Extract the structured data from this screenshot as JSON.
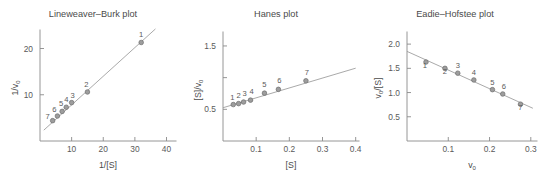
{
  "figure": {
    "background": "#ffffff",
    "ink_color": "#5a5a5a",
    "marker_fill": "#9d9d9d",
    "marker_stroke": "#6d6d6d",
    "line_color": "#9a9a9a"
  },
  "chart_data": [
    {
      "type": "scatter",
      "title": "Lineweaver–Burk plot",
      "xlabel": "1/[S]",
      "ylabel": "1/v₀",
      "ylabel_parts": {
        "main": "1/v",
        "sub": "0"
      },
      "xlim": [
        0,
        43
      ],
      "ylim": [
        0,
        24
      ],
      "xticks": [
        10,
        20,
        30,
        40
      ],
      "xtick_labels": [
        "10",
        "20",
        "30",
        "40"
      ],
      "yticks": [
        10,
        20
      ],
      "ytick_labels": [
        "10",
        "20"
      ],
      "grid": false,
      "legend": "none",
      "point_labels": [
        "1",
        "2",
        "3",
        "4",
        "5",
        "6",
        "7"
      ],
      "x": [
        32.0,
        15.0,
        10.0,
        8.3,
        7.0,
        5.5,
        4.0
      ],
      "y": [
        21.3,
        10.6,
        8.3,
        7.3,
        6.4,
        5.4,
        4.4
      ],
      "fit": {
        "slope": 0.62,
        "intercept": 1.6,
        "x_start": 1.2,
        "x_end": 36.5
      },
      "label_offsets": [
        [
          0,
          -5
        ],
        [
          -1,
          -5
        ],
        [
          1,
          -5
        ],
        [
          0,
          -5
        ],
        [
          -1,
          -5
        ],
        [
          -3,
          -4
        ],
        [
          -5,
          -2
        ]
      ]
    },
    {
      "type": "scatter",
      "title": "Hanes plot",
      "xlabel": "[S]",
      "ylabel": "[S]/v₀",
      "ylabel_parts": {
        "main": "[S]/v",
        "sub": "0"
      },
      "xlim": [
        0,
        0.41
      ],
      "ylim": [
        0,
        1.72
      ],
      "xticks": [
        0.1,
        0.2,
        0.3,
        0.4
      ],
      "xtick_labels": [
        "0.1",
        "0.2",
        "0.3",
        "0.4"
      ],
      "yticks": [
        0.5,
        1.0,
        1.5
      ],
      "ytick_labels": [
        "0.5",
        "",
        "1.5"
      ],
      "grid": false,
      "legend": "none",
      "point_labels": [
        "1",
        "2",
        "3",
        "4",
        "5",
        "6",
        "7"
      ],
      "x": [
        0.031,
        0.047,
        0.062,
        0.083,
        0.125,
        0.167,
        0.25
      ],
      "y": [
        0.575,
        0.59,
        0.615,
        0.645,
        0.755,
        0.815,
        0.95
      ],
      "fit": {
        "slope": 1.56,
        "intercept": 0.525,
        "x_start": 0.0,
        "x_end": 0.4
      },
      "label_offsets": [
        [
          -1,
          -5
        ],
        [
          0,
          -6
        ],
        [
          1,
          -6
        ],
        [
          1,
          -6
        ],
        [
          0,
          -6
        ],
        [
          1,
          -6
        ],
        [
          1,
          -6
        ]
      ]
    },
    {
      "type": "scatter",
      "title": "Eadie–Hofstee plot",
      "xlabel": "v₀",
      "xlabel_parts": {
        "main": "v",
        "sub": "0"
      },
      "ylabel": "v₀/[S]",
      "ylabel_parts": {
        "main": "v",
        "sub": "0",
        "tail": "/[S]"
      },
      "xlim": [
        0,
        0.315
      ],
      "ylim": [
        0,
        2.25
      ],
      "xticks": [
        0.1,
        0.2,
        0.3
      ],
      "xtick_labels": [
        "0.1",
        "0.2",
        "0.3"
      ],
      "yticks": [
        0.5,
        1.0,
        1.5,
        2.0
      ],
      "ytick_labels": [
        "0.5",
        "1.0",
        "1.5",
        "2.0"
      ],
      "grid": false,
      "legend": "none",
      "point_labels": [
        "1",
        "2",
        "3",
        "4",
        "5",
        "6",
        "7"
      ],
      "x": [
        0.046,
        0.092,
        0.123,
        0.162,
        0.207,
        0.232,
        0.275
      ],
      "y": [
        1.63,
        1.5,
        1.4,
        1.26,
        1.06,
        0.97,
        0.76
      ],
      "fit": {
        "slope": -3.85,
        "intercept": 1.85,
        "x_start": 0.0,
        "x_end": 0.305
      },
      "label_offsets": [
        [
          -1,
          6
        ],
        [
          0,
          6
        ],
        [
          0,
          -5
        ],
        [
          0,
          -5
        ],
        [
          0,
          -5
        ],
        [
          1,
          -5
        ],
        [
          0,
          6
        ]
      ]
    }
  ]
}
